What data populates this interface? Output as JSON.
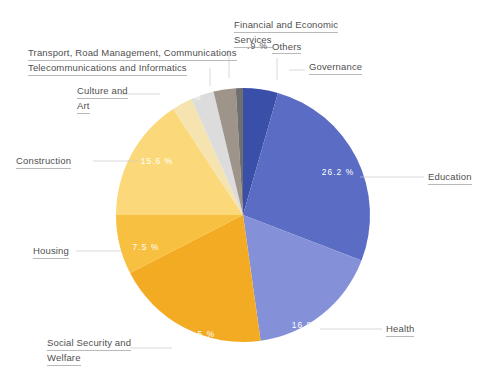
{
  "chart_data": {
    "type": "pie",
    "title": "",
    "legend_position": "callout-labels",
    "categories": [
      "Governance",
      "Education",
      "Health",
      "Social Security and Welfare",
      "Housing",
      "Construction",
      "Culture and Art",
      "Transport, Road Management, Communications Telecommunications and Informatics",
      "Financial and Economic Services",
      "Others"
    ],
    "values": [
      4.4,
      26.2,
      16.8,
      19.5,
      7.5,
      15.6,
      2.6,
      2.9,
      2.8,
      0.9
    ],
    "value_labels": [
      "4.4 %",
      "26.2 %",
      "16.8 %",
      "19.5 %",
      "7.5 %",
      "15.6 %",
      "2.6 %",
      "2.9 %",
      "2.8 %",
      ".9 %"
    ],
    "colors": [
      "#3a4fa8",
      "#5a6cc4",
      "#8490d8",
      "#f2ab22",
      "#f8c040",
      "#fbd97a",
      "#f5e3b0",
      "#dcdcdc",
      "#9e948a",
      "#6f6f6f"
    ],
    "start_angle_deg": 0,
    "direction": "clockwise",
    "units": "percent",
    "total": 100
  },
  "slices": {
    "governance": {
      "label": "Governance",
      "pct": "4.4 %",
      "color": "#3a4fa8"
    },
    "education": {
      "label": "Education",
      "pct": "26.2 %",
      "color": "#5a6cc4"
    },
    "health": {
      "label": "Health",
      "pct": "16.8 %",
      "color": "#8490d8"
    },
    "social_security": {
      "label_line1": "Social Security and",
      "label_line2": "Welfare",
      "pct": "19.5 %",
      "color": "#f2ab22"
    },
    "housing": {
      "label": "Housing",
      "pct": "7.5 %",
      "color": "#f8c040"
    },
    "construction": {
      "label": "Construction",
      "pct": "15.6 %",
      "color": "#fbd97a"
    },
    "culture_art": {
      "label_line1": "Culture and",
      "label_line2": "Art",
      "pct": "2.6 %",
      "color": "#f5e3b0"
    },
    "transport": {
      "label_line1": "Transport, Road Management, Communications",
      "label_line2": "Telecommunications and Informatics",
      "pct": "2.9 %",
      "color": "#dcdcdc"
    },
    "financial": {
      "label_line1": "Financial and Economic",
      "label_line2": "Services",
      "pct": "2.8 %",
      "color": "#9e948a"
    },
    "others": {
      "label": "Others",
      "pct": ".9 %",
      "color": "#6f6f6f"
    }
  }
}
